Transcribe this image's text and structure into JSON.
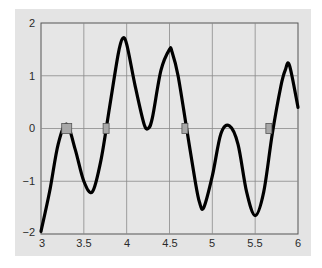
{
  "chart_data": {
    "type": "line",
    "title": "",
    "xlabel": "",
    "ylabel": "",
    "xlim": [
      3,
      6
    ],
    "ylim": [
      -2,
      2
    ],
    "grid": true,
    "legend": null,
    "x_ticks": [
      "3",
      "3.5",
      "4",
      "4.5",
      "5",
      "5.5",
      "6"
    ],
    "y_ticks": [
      "2",
      "1",
      "0",
      "−1",
      "−2"
    ],
    "series": [
      {
        "name": "f(x)",
        "color": "#000000",
        "x": [
          3.0,
          3.1,
          3.2,
          3.3,
          3.4,
          3.5,
          3.6,
          3.7,
          3.8,
          3.9,
          3.95,
          4.0,
          4.1,
          4.2,
          4.25,
          4.3,
          4.4,
          4.5,
          4.53,
          4.6,
          4.7,
          4.8,
          4.85,
          4.9,
          5.0,
          5.1,
          5.2,
          5.3,
          5.4,
          5.5,
          5.6,
          5.7,
          5.8,
          5.85,
          5.9,
          6.0
        ],
        "y": [
          -1.95,
          -1.2,
          -0.3,
          0.08,
          -0.4,
          -1.0,
          -1.2,
          -0.6,
          0.4,
          1.4,
          1.7,
          1.6,
          0.8,
          0.1,
          0.0,
          0.2,
          1.1,
          1.5,
          1.45,
          1.0,
          0.0,
          -1.0,
          -1.4,
          -1.5,
          -0.9,
          -0.1,
          0.05,
          -0.3,
          -1.2,
          -1.65,
          -1.2,
          -0.1,
          0.8,
          1.1,
          1.2,
          0.4
        ]
      }
    ],
    "markers": {
      "label": "zero crossings",
      "color": "#a8a8a8",
      "x": [
        3.3,
        3.76,
        4.68,
        5.66
      ],
      "y": [
        0,
        0,
        0,
        0
      ]
    }
  },
  "axes": {
    "y_labels": [
      "2",
      "1",
      "0",
      "−1",
      "−2"
    ],
    "x_labels": [
      "3",
      "3.5",
      "4",
      "4.5",
      "5",
      "5.5",
      "6"
    ]
  }
}
